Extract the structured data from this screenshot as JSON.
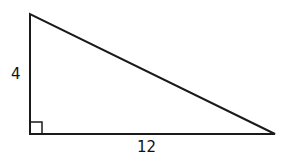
{
  "diagram": {
    "type": "right-triangle",
    "vertices": {
      "top": [
        30,
        14
      ],
      "right_angle": [
        30,
        134
      ],
      "right": [
        275,
        134
      ]
    },
    "right_angle_marker_size": 12,
    "stroke_color": "#1a1a1a",
    "labels": {
      "vertical_leg": "4",
      "horizontal_leg": "12"
    }
  }
}
